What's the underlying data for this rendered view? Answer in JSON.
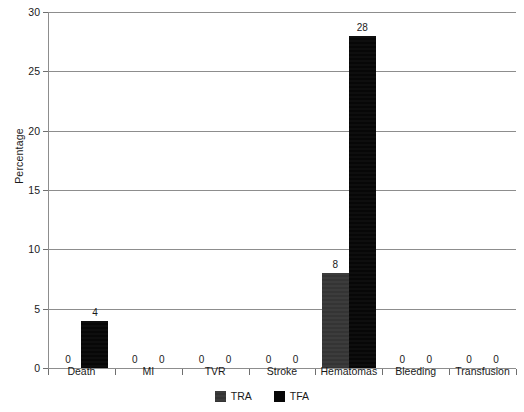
{
  "chart_data": {
    "type": "bar",
    "title": "",
    "xlabel": "",
    "ylabel": "Percentage",
    "ylim": [
      0,
      30
    ],
    "yticks": [
      0,
      5,
      10,
      15,
      20,
      25,
      30
    ],
    "grid": true,
    "legend_position": "bottom-center",
    "categories": [
      "Death",
      "MI",
      "TVR",
      "Stroke",
      "Hematomas",
      "Bleeding",
      "Transfusion"
    ],
    "series": [
      {
        "name": "TRA",
        "color": "#3a3a3a",
        "values": [
          0,
          0,
          0,
          0,
          8,
          0,
          0
        ],
        "labels": [
          "0",
          "0",
          "0",
          "0",
          "8",
          "0",
          "0"
        ]
      },
      {
        "name": "TFA",
        "color": "#070707",
        "values": [
          4,
          0,
          0,
          0,
          28,
          0,
          0
        ],
        "labels": [
          "4",
          "0",
          "0",
          "0",
          "28",
          "0",
          "0"
        ]
      }
    ]
  },
  "legend": {
    "items": [
      {
        "label": "TRA",
        "swatch": "tra"
      },
      {
        "label": "TFA",
        "swatch": "tfa"
      }
    ]
  },
  "colors": {
    "tra": "#3a3a3a",
    "tfa": "#070707",
    "grid": "#8d8d8d",
    "axis": "#6f6f6f",
    "text": "#1a1a1a",
    "background": "#ffffff"
  }
}
